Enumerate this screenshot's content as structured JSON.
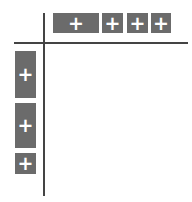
{
  "grid": {
    "add_glyph": "+",
    "columns": [
      {
        "label": "+",
        "x": 53,
        "w": 46
      },
      {
        "label": "+",
        "x": 102,
        "w": 21
      },
      {
        "label": "+",
        "x": 127,
        "w": 21
      },
      {
        "label": "+",
        "x": 151,
        "w": 20
      }
    ],
    "rows": [
      {
        "label": "+",
        "y": 51,
        "h": 47
      },
      {
        "label": "+",
        "y": 103,
        "h": 45
      },
      {
        "label": "+",
        "y": 153,
        "h": 21
      }
    ],
    "colors": {
      "header_bg": "#6b6b6b",
      "header_fg": "#ffffff",
      "line": "#444444"
    }
  }
}
